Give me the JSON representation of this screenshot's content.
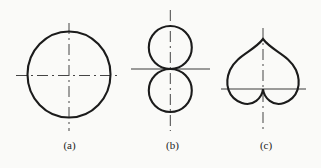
{
  "figure": {
    "panels": [
      {
        "label": "(a)",
        "shape": "circle-with-crosshair-centerlines"
      },
      {
        "label": "(b)",
        "shape": "two-tangent-circles-figure-eight"
      },
      {
        "label": "(c)",
        "shape": "cardioid-heart-curve"
      }
    ],
    "colors": {
      "background": "#fafaf8",
      "shape_stroke": "#1b1b1b",
      "centerline": "#444444",
      "axisline": "#3a3a3a"
    }
  }
}
